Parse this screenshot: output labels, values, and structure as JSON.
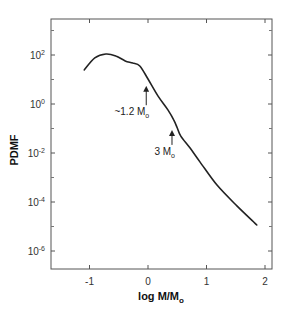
{
  "chart_data": {
    "type": "line",
    "title": "",
    "xlabel": "log M/M",
    "xlabel_sub": "o",
    "ylabel": "PDMF",
    "xlim": [
      -1.5,
      2.15
    ],
    "ylim_log10": [
      -6.85,
      3.6
    ],
    "yscale": "log",
    "grid": false,
    "legend": null,
    "x_ticks": [
      {
        "value": -1,
        "label": "-1"
      },
      {
        "value": 0,
        "label": "0"
      },
      {
        "value": 1,
        "label": "1"
      },
      {
        "value": 2,
        "label": "2"
      }
    ],
    "y_ticks": [
      {
        "exp": 2,
        "base": "10",
        "sup": "2"
      },
      {
        "exp": 0,
        "base": "10",
        "sup": "0"
      },
      {
        "exp": -2,
        "base": "10",
        "sup": "-2"
      },
      {
        "exp": -4,
        "base": "10",
        "sup": "-4"
      },
      {
        "exp": -6,
        "base": "10",
        "sup": "-6"
      }
    ],
    "y_minor_exps": [
      3,
      1,
      -1,
      -3,
      -5
    ],
    "series": [
      {
        "name": "PDMF",
        "x": [
          -1.09,
          -0.91,
          -0.72,
          -0.55,
          -0.39,
          -0.26,
          -0.14,
          0.0,
          0.17,
          0.34,
          0.44,
          0.5,
          0.56,
          0.72,
          0.89,
          1.18,
          1.52,
          1.86
        ],
        "log10_y": [
          1.39,
          1.88,
          2.04,
          1.96,
          1.76,
          1.67,
          1.55,
          1.02,
          0.33,
          -0.24,
          -0.65,
          -0.98,
          -1.31,
          -1.8,
          -2.37,
          -3.31,
          -4.16,
          -4.94
        ],
        "color": "#222222"
      }
    ],
    "annotations": [
      {
        "text": "~1.2 M",
        "sub": "o",
        "arrow_x": -0.03,
        "arrow_from_log10": -0.05,
        "arrow_to_log10": 0.74
      },
      {
        "text": "3 M",
        "sub": "o",
        "arrow_x": 0.41,
        "arrow_from_log10": -1.67,
        "arrow_to_log10": -1.06
      }
    ]
  }
}
